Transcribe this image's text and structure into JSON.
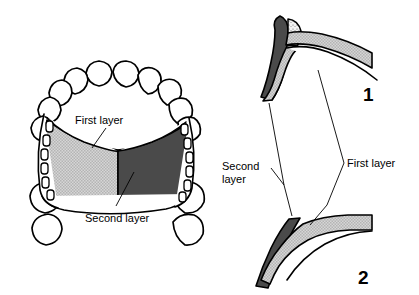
{
  "figure": {
    "background_color": "#ffffff",
    "width": 419,
    "height": 295,
    "panels": [
      {
        "id": "occlusal-view",
        "name": "Maxillary arch occlusal view",
        "labels": {
          "first_layer": "First layer",
          "second_layer": "Second layer"
        }
      },
      {
        "id": "sectional-views",
        "name": "Cross-sectional views",
        "labels": {
          "second_layer_line1": "Second",
          "second_layer_line2": "layer",
          "first_layer": "First layer"
        },
        "figure_numbers": {
          "upper": "1",
          "lower": "2"
        }
      }
    ],
    "colors": {
      "outline": "#000000",
      "first_layer_fill": "#c9c9c9",
      "second_layer_fill": "#4a4a4a",
      "stipple_fill": "#efefef",
      "page_background": "#ffffff"
    }
  }
}
